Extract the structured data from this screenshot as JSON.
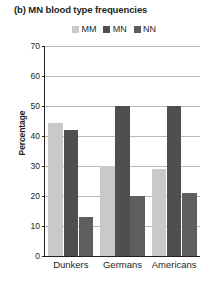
{
  "chart_data": {
    "type": "bar",
    "title": "(b) MN blood type frequencies",
    "xlabel": "",
    "ylabel": "Percentage",
    "categories": [
      "Dunkers",
      "Germans",
      "Americans"
    ],
    "series": [
      {
        "name": "MM",
        "color": "#c9c9c9",
        "values": [
          44.5,
          30,
          29
        ]
      },
      {
        "name": "MN",
        "color": "#4f4f4f",
        "values": [
          42,
          50,
          50
        ]
      },
      {
        "name": "NN",
        "color": "#5e5e5e",
        "values": [
          13,
          20,
          21
        ]
      }
    ],
    "ylim": [
      0,
      70
    ],
    "yticks": [
      0,
      10,
      20,
      30,
      40,
      50,
      60,
      70
    ],
    "ytick_labels": [
      "0",
      "10",
      "20",
      "30",
      "40",
      "50",
      "60",
      "70"
    ],
    "grid": "horizontal",
    "legend_position": "top-right"
  },
  "legend": {
    "items": [
      {
        "label": "MM",
        "color": "#c9c9c9",
        "swatch_name": "legend-swatch-mm"
      },
      {
        "label": "MN",
        "color": "#4f4f4f",
        "swatch_name": "legend-swatch-mn"
      },
      {
        "label": "NN",
        "color": "#5e5e5e",
        "swatch_name": "legend-swatch-nn"
      }
    ]
  },
  "axes": {
    "y_title": "Percentage",
    "x_group_labels": [
      "Dunkers",
      "Germans",
      "Americans"
    ]
  },
  "colors": {
    "text": "#231f20",
    "gridline": "#b9b9b9",
    "axis": "#231f20",
    "background": "#ffffff"
  }
}
